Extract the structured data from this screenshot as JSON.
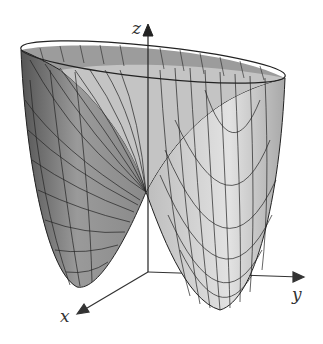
{
  "figure": {
    "axes": {
      "x_label": "x",
      "y_label": "y",
      "z_label": "z"
    },
    "colors": {
      "surface_dark": "#6e6e6e",
      "surface_light": "#d8d8d8",
      "mesh_line": "#222222",
      "axis": "#333333"
    }
  }
}
